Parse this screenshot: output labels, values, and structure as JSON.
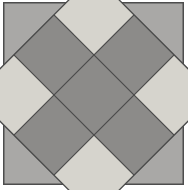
{
  "figure": {
    "canvas_width": 188,
    "canvas_height": 190,
    "background_color": "#ffffff",
    "frame": {
      "x": 3,
      "y": 2,
      "width": 181,
      "height": 183,
      "fill_color": "#a9a8a6",
      "border_color": "#4d4d4d",
      "border_width": 1.5
    },
    "diamond": {
      "description": "3x3 checkerboard square rotated 45 degrees",
      "center_x": 94,
      "center_y": 95,
      "half_diagonal": 85,
      "rotation_degrees": 45,
      "grid_rows": 3,
      "grid_cols": 3,
      "grid_line_color": "#4a4a4a",
      "grid_line_width": 1.2
    },
    "colors": {
      "light_tile": "#d6d4cd",
      "dark_tile": "#8c8b89",
      "background_gray": "#a9a8a6",
      "outline": "#4a4a4a",
      "page_white": "#ffffff"
    },
    "tiles": [
      {
        "row": 0,
        "col": 0,
        "shade": "light",
        "color": "#d6d4cd"
      },
      {
        "row": 0,
        "col": 1,
        "shade": "dark",
        "color": "#8c8b89"
      },
      {
        "row": 0,
        "col": 2,
        "shade": "light",
        "color": "#d6d4cd"
      },
      {
        "row": 1,
        "col": 0,
        "shade": "dark",
        "color": "#8c8b89"
      },
      {
        "row": 1,
        "col": 1,
        "shade": "dark",
        "color": "#8c8b89"
      },
      {
        "row": 1,
        "col": 2,
        "shade": "dark",
        "color": "#8c8b89"
      },
      {
        "row": 2,
        "col": 0,
        "shade": "light",
        "color": "#d6d4cd"
      },
      {
        "row": 2,
        "col": 1,
        "shade": "dark",
        "color": "#8c8b89"
      },
      {
        "row": 2,
        "col": 2,
        "shade": "light",
        "color": "#d6d4cd"
      }
    ],
    "tile_count": 9,
    "light_tile_count": 4,
    "dark_tile_count": 5
  }
}
